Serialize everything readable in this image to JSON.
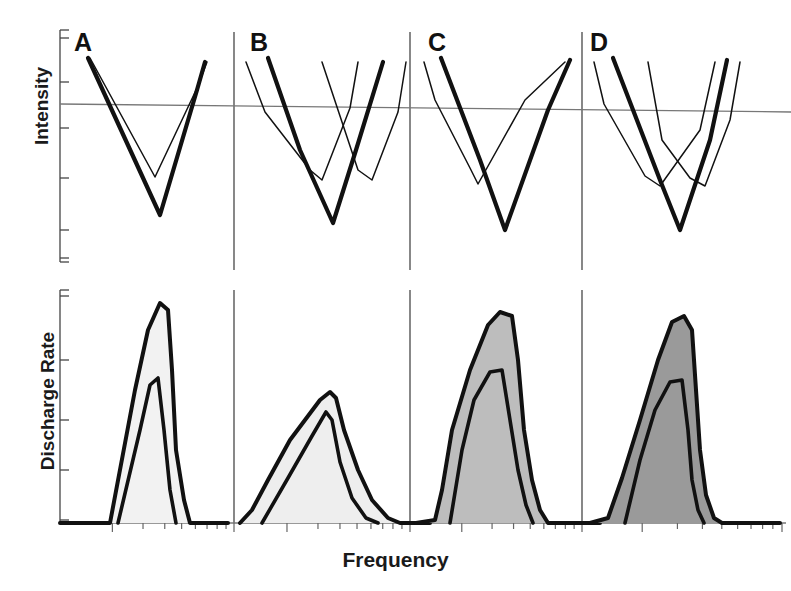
{
  "figure": {
    "axes": {
      "y_top_label": "Intensity",
      "y_bottom_label": "Discharge Rate",
      "x_label": "Frequency"
    },
    "panels": [
      {
        "letter": "A",
        "letter_x": 74,
        "letter_y": 28
      },
      {
        "letter": "B",
        "letter_x": 250,
        "letter_y": 28
      },
      {
        "letter": "C",
        "letter_x": 428,
        "letter_y": 28
      },
      {
        "letter": "D",
        "letter_x": 590,
        "letter_y": 28
      }
    ]
  },
  "chart_data": {
    "type": "line",
    "title": "",
    "xlabel": "Frequency",
    "ylabel_top": "Intensity",
    "ylabel_bottom": "Discharge Rate",
    "grid": false,
    "legend": false,
    "panel_dividers_x": [
      234,
      410,
      582
    ],
    "top_row": {
      "reference_line": {
        "x1": 60,
        "y1": 104,
        "x2": 791,
        "y2": 112
      },
      "axis_x": 60,
      "axis_y_top": 30,
      "axis_y_bottom": 262,
      "y_ticks": [
        38,
        82,
        128,
        178,
        230,
        258
      ],
      "panels": [
        {
          "letter": "A",
          "curves": [
            {
              "weight": "thick",
              "points": [
                [
                  88,
                  58
                ],
                [
                  160,
                  215
                ],
                [
                  197,
                  90
                ],
                [
                  205,
                  62
                ]
              ]
            },
            {
              "weight": "thin",
              "points": [
                [
                  90,
                  58
                ],
                [
                  155,
                  177
                ],
                [
                  198,
                  86
                ],
                [
                  207,
                  62
                ]
              ]
            }
          ]
        },
        {
          "letter": "B",
          "curves": [
            {
              "weight": "thin",
              "points": [
                [
                  246,
                  62
                ],
                [
                  265,
                  112
                ],
                [
                  310,
                  170
                ],
                [
                  322,
                  180
                ],
                [
                  350,
                  108
                ],
                [
                  358,
                  62
                ]
              ]
            },
            {
              "weight": "thick",
              "points": [
                [
                  268,
                  58
                ],
                [
                  300,
                  150
                ],
                [
                  333,
                  223
                ],
                [
                  356,
                  150
                ],
                [
                  383,
                  62
                ]
              ]
            },
            {
              "weight": "thin",
              "points": [
                [
                  322,
                  62
                ],
                [
                  358,
                  170
                ],
                [
                  372,
                  180
                ],
                [
                  398,
                  112
                ],
                [
                  406,
                  62
                ]
              ]
            }
          ]
        },
        {
          "letter": "C",
          "curves": [
            {
              "weight": "thin",
              "points": [
                [
                  424,
                  62
                ],
                [
                  435,
                  100
                ],
                [
                  470,
                  168
                ],
                [
                  478,
                  184
                ],
                [
                  525,
                  100
                ],
                [
                  565,
                  62
                ]
              ]
            },
            {
              "weight": "thick",
              "points": [
                [
                  441,
                  58
                ],
                [
                  480,
                  160
                ],
                [
                  505,
                  230
                ],
                [
                  548,
                  110
                ],
                [
                  570,
                  60
                ]
              ]
            }
          ]
        },
        {
          "letter": "D",
          "curves": [
            {
              "weight": "thin",
              "points": [
                [
                  594,
                  62
                ],
                [
                  604,
                  104
                ],
                [
                  645,
                  176
                ],
                [
                  660,
                  186
                ],
                [
                  700,
                  130
                ],
                [
                  715,
                  62
                ]
              ]
            },
            {
              "weight": "thick",
              "points": [
                [
                  613,
                  58
                ],
                [
                  660,
                  180
                ],
                [
                  680,
                  230
                ],
                [
                  710,
                  140
                ],
                [
                  727,
                  60
                ]
              ]
            },
            {
              "weight": "thin",
              "points": [
                [
                  648,
                  62
                ],
                [
                  662,
                  140
                ],
                [
                  690,
                  178
                ],
                [
                  705,
                  186
                ],
                [
                  730,
                  120
                ],
                [
                  740,
                  62
                ]
              ]
            }
          ]
        }
      ]
    },
    "bottom_row": {
      "axis_x": 60,
      "axis_y_top": 290,
      "baseline_y": 523,
      "y_ticks": [
        296,
        360,
        420,
        470,
        520
      ],
      "panels": [
        {
          "letter": "A",
          "fill_color": "#f2f2f2",
          "peak_height_rel": 0.95,
          "outer": [
            [
              60,
              523
            ],
            [
              110,
              523
            ],
            [
              135,
              390
            ],
            [
              148,
              330
            ],
            [
              160,
              303
            ],
            [
              168,
              310
            ],
            [
              172,
              370
            ],
            [
              176,
              450
            ],
            [
              184,
              500
            ],
            [
              190,
              523
            ],
            [
              228,
              523
            ]
          ],
          "inner": [
            [
              118,
              523
            ],
            [
              140,
              430
            ],
            [
              150,
              385
            ],
            [
              158,
              378
            ],
            [
              164,
              430
            ],
            [
              170,
              490
            ],
            [
              176,
              523
            ]
          ]
        },
        {
          "letter": "B",
          "fill_color": "#eeeeee",
          "peak_height_rel": 0.52,
          "outer": [
            [
              240,
              523
            ],
            [
              252,
              510
            ],
            [
              268,
              480
            ],
            [
              290,
              440
            ],
            [
              320,
              400
            ],
            [
              330,
              392
            ],
            [
              336,
              398
            ],
            [
              344,
              430
            ],
            [
              358,
              470
            ],
            [
              372,
              500
            ],
            [
              388,
              518
            ],
            [
              400,
              523
            ],
            [
              430,
              523
            ]
          ],
          "inner": [
            [
              262,
              523
            ],
            [
              288,
              478
            ],
            [
              312,
              436
            ],
            [
              326,
              412
            ],
            [
              332,
              420
            ],
            [
              340,
              462
            ],
            [
              352,
              498
            ],
            [
              366,
              518
            ],
            [
              378,
              523
            ]
          ]
        },
        {
          "letter": "C",
          "fill_color": "#bdbdbd",
          "peak_height_rel": 0.88,
          "outer": [
            [
              416,
              523
            ],
            [
              435,
              520
            ],
            [
              442,
              490
            ],
            [
              452,
              430
            ],
            [
              470,
              370
            ],
            [
              488,
              325
            ],
            [
              500,
              312
            ],
            [
              512,
              316
            ],
            [
              518,
              360
            ],
            [
              524,
              430
            ],
            [
              532,
              480
            ],
            [
              540,
              510
            ],
            [
              548,
              523
            ],
            [
              600,
              523
            ]
          ],
          "inner": [
            [
              450,
              523
            ],
            [
              462,
              450
            ],
            [
              474,
              400
            ],
            [
              490,
              372
            ],
            [
              502,
              370
            ],
            [
              510,
              420
            ],
            [
              518,
              470
            ],
            [
              526,
              505
            ],
            [
              533,
              523
            ]
          ]
        },
        {
          "letter": "D",
          "fill_color": "#9a9a9a",
          "peak_height_rel": 0.92,
          "outer": [
            [
              590,
              523
            ],
            [
              608,
              518
            ],
            [
              622,
              478
            ],
            [
              640,
              420
            ],
            [
              658,
              360
            ],
            [
              672,
              322
            ],
            [
              684,
              316
            ],
            [
              692,
              330
            ],
            [
              696,
              390
            ],
            [
              700,
              450
            ],
            [
              706,
              495
            ],
            [
              714,
              518
            ],
            [
              722,
              523
            ],
            [
              780,
              523
            ]
          ],
          "inner": [
            [
              625,
              523
            ],
            [
              640,
              460
            ],
            [
              655,
              410
            ],
            [
              670,
              382
            ],
            [
              682,
              380
            ],
            [
              688,
              430
            ],
            [
              692,
              480
            ],
            [
              698,
              510
            ],
            [
              704,
              523
            ]
          ]
        }
      ]
    }
  }
}
